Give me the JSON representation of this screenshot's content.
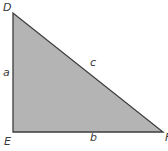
{
  "diagram": {
    "type": "right-triangle",
    "fill_color": "#b4b4b4",
    "stroke_color": "#3c3c3c",
    "vertices": [
      {
        "label": "D",
        "role": "top-vertex"
      },
      {
        "label": "E",
        "role": "right-angle-vertex"
      },
      {
        "label": "F",
        "role": "right-vertex"
      }
    ],
    "sides": [
      {
        "label": "a",
        "between": "D-E"
      },
      {
        "label": "b",
        "between": "E-F"
      },
      {
        "label": "c",
        "between": "D-F"
      }
    ]
  }
}
